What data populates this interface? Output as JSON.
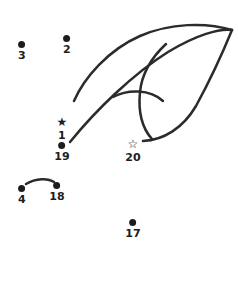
{
  "puzzle": {
    "title": "Connect the dots puzzle",
    "background_color": "#ffffff",
    "stroke_color": "#2b2b2b",
    "label_color": "#1d1d1d",
    "stroke_width": 2.5,
    "width": 238,
    "height": 284
  },
  "points": [
    {
      "label": "1",
      "marker": "filled-star",
      "glyph": "★",
      "x": 62,
      "y": 117,
      "label_y": 126
    },
    {
      "label": "2",
      "marker": "dot",
      "glyph": "",
      "x": 67,
      "y": 35,
      "label_y": 45
    },
    {
      "label": "3",
      "marker": "dot",
      "glyph": "",
      "x": 22,
      "y": 41,
      "label_y": 51
    },
    {
      "label": "4",
      "marker": "dot",
      "glyph": "",
      "x": 22,
      "y": 185,
      "label_y": 195
    },
    {
      "label": "17",
      "marker": "dot",
      "glyph": "",
      "x": 133,
      "y": 219,
      "label_y": 229
    },
    {
      "label": "18",
      "marker": "dot",
      "glyph": "",
      "x": 57,
      "y": 182,
      "label_y": 192
    },
    {
      "label": "19",
      "marker": "dot",
      "glyph": "",
      "x": 62,
      "y": 142,
      "label_y": 152
    },
    {
      "label": "20",
      "marker": "open-star",
      "glyph": "☆",
      "x": 133,
      "y": 139,
      "label_y": 149
    }
  ],
  "strokes": [
    {
      "name": "outer-upper-wing-arc",
      "d": "M 74 101 C 84 78, 108 50, 140 36 C 170 23, 206 22, 232 30"
    },
    {
      "name": "lower-wing-edge",
      "d": "M 70 142 C 96 110, 133 74, 168 52 C 196 35, 220 28, 232 30"
    },
    {
      "name": "inner-feather-line",
      "d": "M 166 44 C 152 57, 142 72, 140 92 C 138 112, 142 128, 152 139"
    },
    {
      "name": "right-outer-sweep",
      "d": "M 232 30 C 223 52, 208 84, 196 106 C 183 128, 164 140, 143 141"
    },
    {
      "name": "interior-eyebrow-arc",
      "d": "M 113 97 C 128 89, 150 89, 163 101"
    },
    {
      "name": "dot4-to-dot18-arc",
      "d": "M 26 184 C 36 178, 48 178, 54 182"
    }
  ]
}
